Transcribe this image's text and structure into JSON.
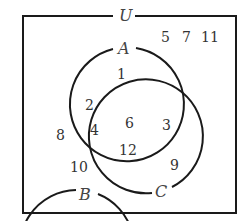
{
  "diagram": {
    "type": "venn",
    "universe_label": "U",
    "sets": [
      {
        "name": "A",
        "label": "A"
      },
      {
        "name": "B",
        "label": "B"
      },
      {
        "name": "C",
        "label": "C"
      }
    ],
    "regions": {
      "outside": [
        "5",
        "7",
        "11"
      ],
      "A_only": [
        "1"
      ],
      "A_and_B_only": [
        "2",
        "4"
      ],
      "A_and_B_and_C": [
        "6",
        "12"
      ],
      "A_and_C_only": [
        "3"
      ],
      "B_only": [
        "8",
        "10"
      ],
      "C_only": [
        "9"
      ],
      "B_and_C_only": []
    },
    "colors": {
      "stroke": "#1a1a1a",
      "text": "#333333"
    }
  }
}
